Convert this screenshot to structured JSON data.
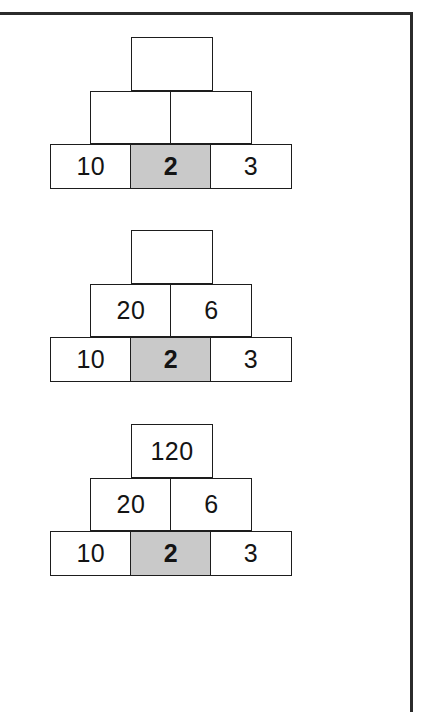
{
  "page": {
    "background_color": "#ffffff",
    "frame_color": "#2b2b2b",
    "shaded_cell_color": "#c9c9c9",
    "cell_border_color": "#1d1d1d"
  },
  "figure": {
    "type": "multiplication-pyramid-sequence",
    "pyramids": [
      {
        "id": "pyramid-1",
        "caption": "",
        "rows": [
          {
            "level": "top",
            "cells": [
              {
                "value": "",
                "shaded": false,
                "filled": false
              }
            ]
          },
          {
            "level": "middle",
            "cells": [
              {
                "value": "",
                "shaded": false,
                "filled": false
              },
              {
                "value": "",
                "shaded": false,
                "filled": false
              }
            ]
          },
          {
            "level": "base",
            "cells": [
              {
                "value": "10",
                "shaded": false,
                "filled": true
              },
              {
                "value": "2",
                "shaded": true,
                "filled": true
              },
              {
                "value": "3",
                "shaded": false,
                "filled": true
              }
            ]
          }
        ]
      },
      {
        "id": "pyramid-2",
        "caption": "",
        "rows": [
          {
            "level": "top",
            "cells": [
              {
                "value": "",
                "shaded": false,
                "filled": false
              }
            ]
          },
          {
            "level": "middle",
            "cells": [
              {
                "value": "20",
                "shaded": false,
                "filled": true
              },
              {
                "value": "6",
                "shaded": false,
                "filled": true
              }
            ]
          },
          {
            "level": "base",
            "cells": [
              {
                "value": "10",
                "shaded": false,
                "filled": true
              },
              {
                "value": "2",
                "shaded": true,
                "filled": true
              },
              {
                "value": "3",
                "shaded": false,
                "filled": true
              }
            ]
          }
        ]
      },
      {
        "id": "pyramid-3",
        "caption": "",
        "rows": [
          {
            "level": "top",
            "cells": [
              {
                "value": "120",
                "shaded": false,
                "filled": true
              }
            ]
          },
          {
            "level": "middle",
            "cells": [
              {
                "value": "20",
                "shaded": false,
                "filled": true
              },
              {
                "value": "6",
                "shaded": false,
                "filled": true
              }
            ]
          },
          {
            "level": "base",
            "cells": [
              {
                "value": "10",
                "shaded": false,
                "filled": true
              },
              {
                "value": "2",
                "shaded": true,
                "filled": true
              },
              {
                "value": "3",
                "shaded": false,
                "filled": true
              }
            ]
          }
        ]
      }
    ]
  }
}
